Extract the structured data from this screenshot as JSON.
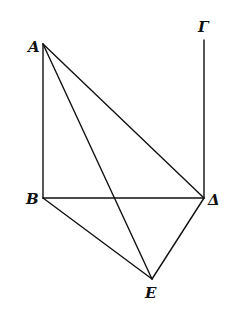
{
  "diagram": {
    "type": "geometric-figure",
    "points": {
      "A": {
        "label": "A",
        "x": 43,
        "y": 44,
        "lx": 28,
        "ly": 52
      },
      "B": {
        "label": "B",
        "x": 43,
        "y": 198,
        "lx": 26,
        "ly": 204
      },
      "Gamma": {
        "label": "Γ",
        "x": 204,
        "y": 40,
        "lx": 198,
        "ly": 32
      },
      "Delta": {
        "label": "Δ",
        "x": 204,
        "y": 198,
        "lx": 208,
        "ly": 205
      },
      "E": {
        "label": "E",
        "x": 152,
        "y": 279,
        "lx": 145,
        "ly": 298
      }
    },
    "segments": [
      {
        "from": "A",
        "to": "B",
        "name": "AB"
      },
      {
        "from": "A",
        "to": "Delta",
        "name": "AΔ"
      },
      {
        "from": "A",
        "to": "E",
        "name": "AE"
      },
      {
        "from": "B",
        "to": "Delta",
        "name": "BΔ"
      },
      {
        "from": "B",
        "to": "E",
        "name": "BE"
      },
      {
        "from": "Delta",
        "to": "E",
        "name": "ΔE"
      },
      {
        "from": "Gamma",
        "to": "Delta",
        "name": "ΓΔ"
      }
    ],
    "colors": {
      "stroke": "#111111",
      "background": "#ffffff"
    }
  }
}
